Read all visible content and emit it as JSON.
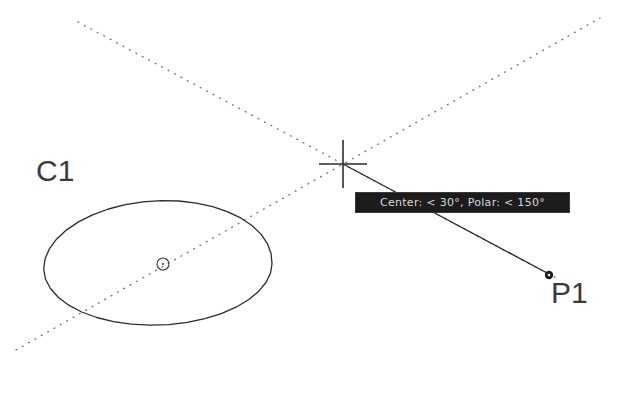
{
  "app": {
    "title": "AutoCAD Polar Tracking",
    "background_color": "#ffffff",
    "line_color": "#2b2b2b",
    "tracking_color": "#555555"
  },
  "tooltip": {
    "text": "Center: < 30°, Polar: < 150°",
    "center_label": "Center:",
    "center_angle": "< 30°",
    "polar_label": "Polar:",
    "polar_angle": "< 150°",
    "background_color": "#1c1c1c",
    "text_color": "#d8d8d8",
    "x": 355,
    "y": 192,
    "width": 215,
    "height": 21
  },
  "labels": {
    "circle": "C1",
    "point": "P1"
  },
  "geometry": {
    "circle": {
      "name": "C1",
      "center_x": 163,
      "center_y": 264,
      "radius": 109,
      "facets": 36
    },
    "center_marker": {
      "x": 163,
      "y": 264,
      "radius": 6
    },
    "crosshair": {
      "x": 343,
      "y": 164,
      "arm_length": 24
    },
    "point_marker": {
      "name": "P1",
      "x": 548,
      "y": 274,
      "size": 7
    },
    "tracking_ray_30deg": {
      "angle_deg": 30,
      "from_x": 16,
      "from_y": 350,
      "to_x": 600,
      "to_y": 18
    },
    "tracking_ray_150deg": {
      "angle_deg": 150,
      "from_x": 78,
      "from_y": 22,
      "to_x": 548,
      "to_y": 274
    },
    "rubber_band": {
      "from_x": 343,
      "from_y": 164,
      "to_x": 548,
      "to_y": 274
    }
  }
}
